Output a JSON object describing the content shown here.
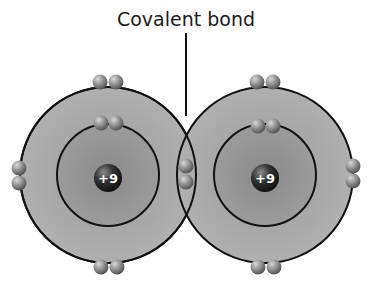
{
  "diagram": {
    "title": "Covalent bond",
    "bond_label": "Covalent bond",
    "atoms": [
      {
        "name": "left-atom",
        "nucleus_charge": "+9",
        "cx": 108,
        "cy": 175,
        "outer_r": 88,
        "inner_r": 51
      },
      {
        "name": "right-atom",
        "nucleus_charge": "+9",
        "cx": 265,
        "cy": 175,
        "outer_r": 88,
        "inner_r": 51
      }
    ],
    "colors": {
      "shell_fill": "#a9a9a9",
      "inner_fill": "#8f8f8f",
      "line": "#111111",
      "electron": "#8a8a8a",
      "nucleus": "#2a2a2a"
    }
  }
}
